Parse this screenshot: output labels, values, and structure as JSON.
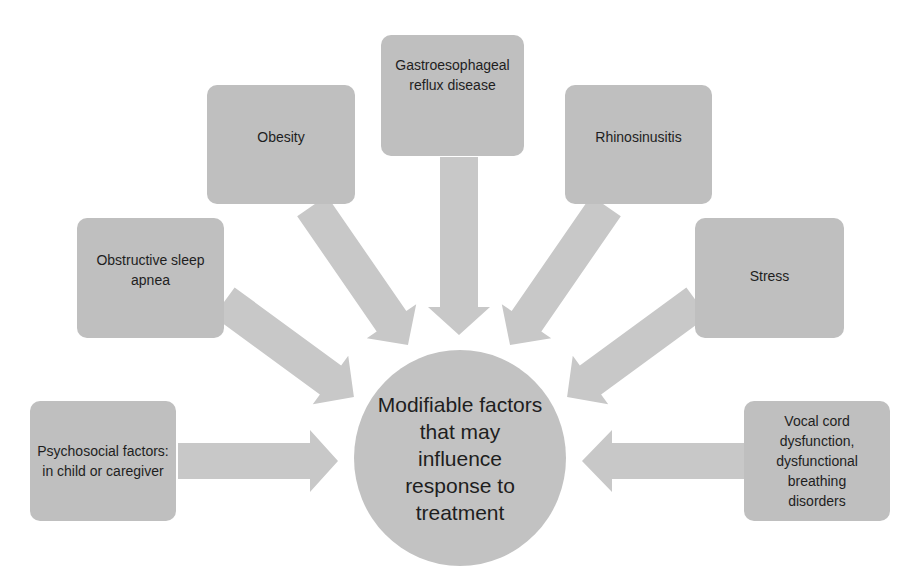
{
  "diagram": {
    "type": "hub-and-spoke",
    "center": {
      "label": "Modifiable factors that may influence response to treatment"
    },
    "factors": [
      {
        "id": "psychosocial",
        "label": "Psychosocial factors: in child or caregiver"
      },
      {
        "id": "osa",
        "label": "Obstructive sleep apnea"
      },
      {
        "id": "obesity",
        "label": "Obesity"
      },
      {
        "id": "gerd",
        "label": "Gastroesophageal reflux disease"
      },
      {
        "id": "rhinosinusitis",
        "label": "Rhinosinusitis"
      },
      {
        "id": "stress",
        "label": "Stress"
      },
      {
        "id": "vocal-cord",
        "label": "Vocal cord dysfunction, dysfunctional breathing disorders"
      }
    ],
    "arrow_direction": "factor-to-center",
    "colors": {
      "box_fill": "#bfbfbf",
      "arrow_fill": "#c8c8c8",
      "center_fill": "#c2c2c2",
      "text": "#1e1e1e",
      "background": "#ffffff"
    }
  }
}
